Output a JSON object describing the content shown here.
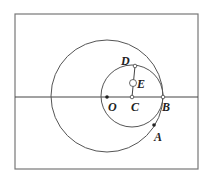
{
  "figure": {
    "stroke_color": "#555555",
    "points": [
      {
        "id": "O",
        "label": "O",
        "kind": "filled"
      },
      {
        "id": "C",
        "label": "C",
        "kind": "filled"
      },
      {
        "id": "B",
        "label": "B",
        "kind": "filled"
      },
      {
        "id": "D",
        "label": "D",
        "kind": "filled"
      },
      {
        "id": "E",
        "label": "E",
        "kind": "hollow"
      },
      {
        "id": "A",
        "label": "A",
        "kind": "filled"
      }
    ],
    "circles": [
      {
        "name": "large-circle",
        "center": "O",
        "through": "B"
      },
      {
        "name": "small-circle",
        "center": "C",
        "through": "B"
      }
    ],
    "segments": [
      {
        "from": "C",
        "to": "D"
      }
    ]
  }
}
